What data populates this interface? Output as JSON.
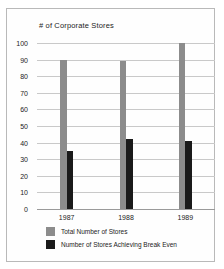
{
  "chart_data": {
    "type": "bar",
    "title": "# of Corporate Stores",
    "xlabel": "",
    "ylabel": "",
    "ylim": [
      0,
      100
    ],
    "ytick_step": 10,
    "yticks": [
      100,
      90,
      80,
      70,
      60,
      50,
      40,
      30,
      20,
      10,
      0
    ],
    "categories": [
      "1987",
      "1988",
      "1989"
    ],
    "grid": true,
    "legend_position": "bottom-left",
    "series": [
      {
        "name": "Total Number of Stores",
        "color": "#8c8c8c",
        "values": [
          90,
          89,
          100
        ]
      },
      {
        "name": "Number of Stores Achieving Break Even",
        "color": "#1a1a1a",
        "values": [
          35,
          42,
          41
        ]
      }
    ]
  },
  "colors": {
    "total": "#8c8c8c",
    "break_even": "#1a1a1a",
    "gridline": "#c9c9c9",
    "axis": "#9a9a9a",
    "border": "#b9b9b9"
  }
}
